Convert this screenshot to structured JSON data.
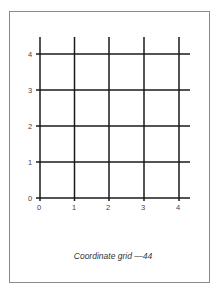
{
  "figure": {
    "caption": "Coordinate grid —44",
    "grid": {
      "x_ticks": [
        "0",
        "1",
        "2",
        "3",
        "4"
      ],
      "y_ticks": [
        "0",
        "1",
        "2",
        "3",
        "4"
      ],
      "x_range": [
        0,
        4
      ],
      "y_range": [
        0,
        4
      ],
      "line_color": "#1a1a1a",
      "frame_color": "#8a8a8a"
    }
  }
}
